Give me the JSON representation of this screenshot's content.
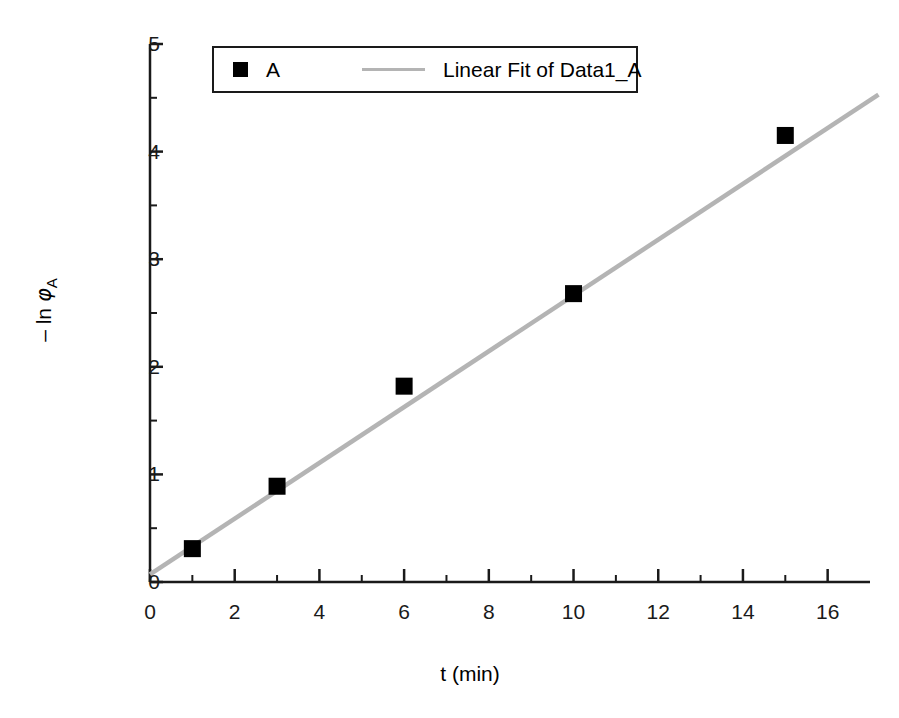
{
  "chart_data": {
    "type": "scatter",
    "title": "",
    "xlabel": "t (min)",
    "ylabel": "– ln φ",
    "ylabel_subscript": "A",
    "xlim": [
      0,
      17
    ],
    "ylim": [
      0,
      5
    ],
    "xticks": [
      0,
      2,
      4,
      6,
      8,
      10,
      12,
      14,
      16
    ],
    "xtick_labels": [
      "0",
      "2",
      "4",
      "6",
      "8",
      "10",
      "12",
      "14",
      "16"
    ],
    "x_minor_ticks": [
      1,
      3,
      5,
      7,
      9,
      11,
      13,
      15
    ],
    "yticks": [
      0,
      1,
      2,
      3,
      4,
      5
    ],
    "ytick_labels": [
      "0",
      "1",
      "2",
      "3",
      "4",
      "5"
    ],
    "y_minor_ticks": [
      0.5,
      1.5,
      2.5,
      3.5,
      4.5
    ],
    "grid": false,
    "legend_position": "top-center",
    "series": [
      {
        "name": "A",
        "type": "scatter",
        "marker": "filled-square",
        "color": "#000000",
        "x": [
          1,
          3,
          6,
          10,
          15
        ],
        "y": [
          0.31,
          0.89,
          1.82,
          2.68,
          4.15
        ]
      },
      {
        "name": "Linear Fit of Data1_A",
        "type": "line",
        "color": "#b4b4b4",
        "x_range": [
          0,
          17.2
        ],
        "y_range": [
          0.07,
          4.53
        ],
        "slope": 0.2593,
        "intercept": 0.07
      }
    ]
  },
  "legend": {
    "entries": [
      {
        "label": "A",
        "swatch": "filled-square-swatch"
      },
      {
        "label": "Linear Fit of Data1_A",
        "swatch": "line-swatch"
      }
    ]
  },
  "axes": {
    "x_title": "t (min)",
    "y_title_prefix": "– ln ",
    "y_title_symbol": "φ",
    "y_title_subscript": "A"
  },
  "colors": {
    "axis": "#1a1a1a",
    "marker": "#000000",
    "fit_line": "#b4b4b4",
    "background": "#ffffff"
  }
}
